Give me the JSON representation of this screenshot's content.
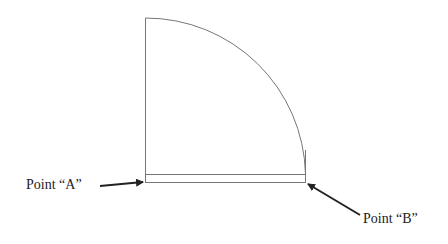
{
  "diagram": {
    "labels": {
      "point_a": "Point “A”",
      "point_b": "Point “B”"
    },
    "colors": {
      "line": "#777777",
      "arrow": "#222222",
      "text": "#222222"
    }
  }
}
